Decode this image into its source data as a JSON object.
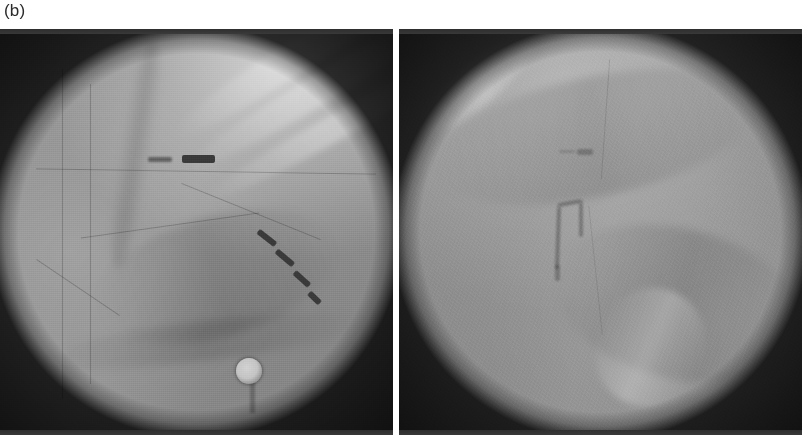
{
  "figure": {
    "label": "(b)",
    "caption": "",
    "modality": "fluoroscopy",
    "panel_count": 2,
    "background_color": "#ffffff"
  },
  "panels": [
    {
      "id": "panel-left",
      "position": "left",
      "alt": "Fluoroscopic projection showing thoracic field with a horizontal radiopaque electrode marker and a diagonal multi-electrode catheter",
      "field_color": "#949494",
      "vignette_color": "#2a2a2a",
      "features": [
        {
          "name": "horizontal-electrode-marker",
          "type": "radiopaque-marker",
          "x_pct": 43,
          "y_pct": 38
        },
        {
          "name": "diagonal-catheter",
          "type": "multi-electrode-catheter",
          "x_pct": 66,
          "y_pct": 58
        },
        {
          "name": "ecg-electrode",
          "type": "surface-electrode",
          "x_pct": 63,
          "y_pct": 88
        },
        {
          "name": "rib-shadows",
          "type": "anatomy"
        },
        {
          "name": "spine-shadow",
          "type": "anatomy"
        }
      ]
    },
    {
      "id": "panel-right",
      "position": "right",
      "alt": "Fluoroscopic projection showing a faint J-shaped catheter loop near the midline with uniform parenchymal field",
      "field_color": "#969696",
      "vignette_color": "#2a2a2a",
      "features": [
        {
          "name": "faint-marker-dot",
          "type": "radiopaque-marker",
          "x_pct": 46,
          "y_pct": 31
        },
        {
          "name": "j-shaped-catheter",
          "type": "catheter-loop",
          "x_pct": 43,
          "y_pct": 52
        },
        {
          "name": "bright-streak",
          "type": "anatomy",
          "x_pct": 68,
          "y_pct": 80
        }
      ]
    }
  ]
}
